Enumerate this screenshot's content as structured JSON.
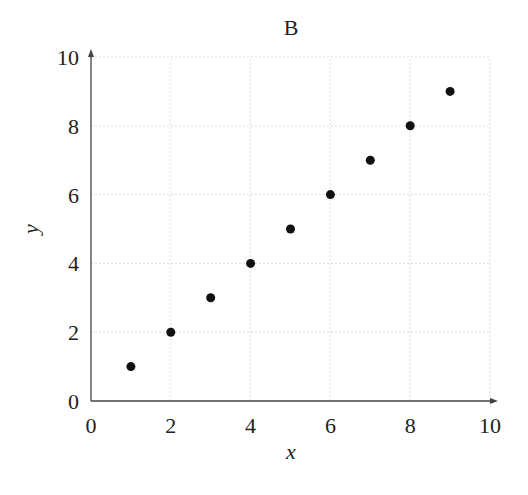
{
  "chart_data": {
    "type": "scatter",
    "title": "B",
    "xlabel": "x",
    "ylabel": "y",
    "xlim": [
      0,
      10
    ],
    "ylim": [
      0,
      10
    ],
    "xticks": [
      0,
      2,
      4,
      6,
      8,
      10
    ],
    "yticks": [
      0,
      2,
      4,
      6,
      8,
      10
    ],
    "grid": true,
    "legend": null,
    "series": [
      {
        "name": "points",
        "color": "#111111",
        "x": [
          1,
          2,
          3,
          4,
          5,
          6,
          7,
          8,
          9
        ],
        "y": [
          1,
          2,
          3,
          4,
          5,
          6,
          7,
          8,
          9
        ]
      }
    ]
  },
  "colors": {
    "axis": "#444444",
    "grid": "#dddddd",
    "marker": "#111111"
  }
}
